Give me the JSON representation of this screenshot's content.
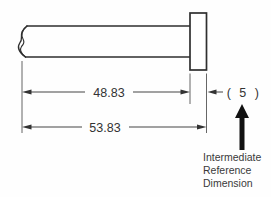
{
  "drawing": {
    "title": "intermediate-reference-dimension-example",
    "part": "headed-pin-side-view",
    "dimensions": {
      "shaft_length": "48.83",
      "overall_length": "53.83",
      "head_reference": "( 5 )"
    },
    "annotation": {
      "line1": "Intermediate",
      "line2": "Reference",
      "line3": "Dimension"
    },
    "colors": {
      "outline": "#2f2f2f",
      "extension_line": "#555555",
      "dimension_line": "#444444",
      "text": "#333333",
      "pointer_arrow": "#111111",
      "background": "#fefefe"
    }
  }
}
